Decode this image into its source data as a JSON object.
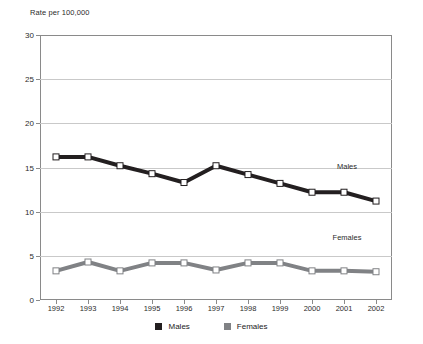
{
  "chart_data": {
    "type": "line",
    "title": "",
    "ylabel": "Rate per 100,000",
    "xlabel": "",
    "categories": [
      "1992",
      "1993",
      "1994",
      "1995",
      "1996",
      "1997",
      "1998",
      "1999",
      "2000",
      "2001",
      "2002"
    ],
    "ylim": [
      0,
      30
    ],
    "yticks": [
      0,
      5,
      10,
      15,
      20,
      25,
      30
    ],
    "ytick_labels": [
      "0",
      "5",
      "10",
      "15",
      "20",
      "25",
      "30"
    ],
    "grid": true,
    "legend_position": "bottom-center",
    "series": [
      {
        "name": "Males",
        "color": "#231f20",
        "values": [
          16.2,
          16.2,
          15.2,
          14.3,
          13.3,
          15.2,
          14.2,
          13.2,
          12.2,
          12.2,
          11.2
        ],
        "annotation": "Males"
      },
      {
        "name": "Females",
        "color": "#808285",
        "values": [
          3.3,
          4.3,
          3.3,
          4.2,
          4.2,
          3.4,
          4.2,
          4.2,
          3.3,
          3.3,
          3.2
        ],
        "annotation": "Females"
      }
    ],
    "annotations": [
      {
        "text": "Males",
        "x": 347,
        "y": 166
      },
      {
        "text": "Females",
        "x": 347,
        "y": 237
      }
    ]
  },
  "legend": {
    "items": [
      {
        "label": "Males",
        "color": "#231f20"
      },
      {
        "label": "Females",
        "color": "#808285"
      }
    ]
  }
}
